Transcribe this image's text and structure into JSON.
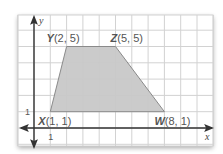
{
  "diagram": {
    "type": "coordinate-plane-polygon",
    "shape": "trapezoid",
    "x_range": [
      -1,
      10
    ],
    "y_range": [
      -1,
      6
    ],
    "grid_step": 1,
    "axis_labels": {
      "x": "x",
      "y": "y"
    },
    "tick_labels": {
      "x_unit": "1",
      "y_unit": "1"
    },
    "vertices": [
      {
        "name": "X",
        "coords": "(1, 1)",
        "x": 1,
        "y": 1
      },
      {
        "name": "Y",
        "coords": "(2, 5)",
        "x": 2,
        "y": 5
      },
      {
        "name": "Z",
        "coords": "(5, 5)",
        "x": 5,
        "y": 5
      },
      {
        "name": "W",
        "coords": "(8, 1)",
        "x": 8,
        "y": 1
      }
    ],
    "colors": {
      "fill": "#c8c8c8",
      "edge": "#8a8a8a",
      "grid": "#d2d2d2",
      "axis": "#333333"
    }
  }
}
